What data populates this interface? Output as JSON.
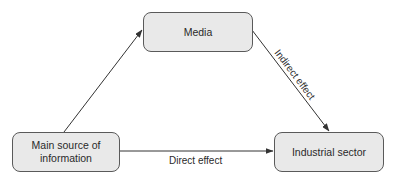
{
  "diagram": {
    "nodes": [
      {
        "id": "media",
        "label": "Media"
      },
      {
        "id": "main_source",
        "label": "Main source of information"
      },
      {
        "id": "industrial_sector",
        "label": "Industrial sector"
      }
    ],
    "edges": [
      {
        "from": "main_source",
        "to": "media",
        "label": ""
      },
      {
        "from": "media",
        "to": "industrial_sector",
        "label": "Indirect effect"
      },
      {
        "from": "main_source",
        "to": "industrial_sector",
        "label": "Direct effect"
      }
    ]
  },
  "colors": {
    "node_fill": "#e9e9e9",
    "node_border": "#5a5a5a",
    "arrow": "#333333",
    "text": "#2a2a2a"
  }
}
